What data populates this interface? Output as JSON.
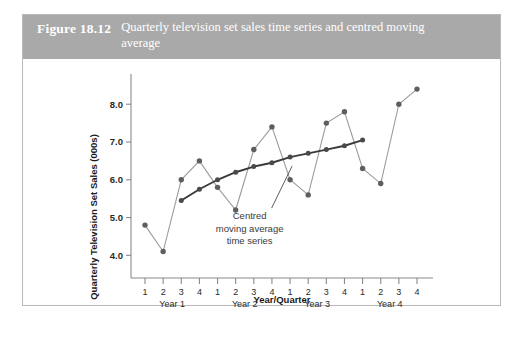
{
  "figure": {
    "number": "Figure 18.12",
    "title": "Quarterly television set sales time series and centred moving average"
  },
  "chart_data": {
    "type": "line",
    "title": "Quarterly television set sales time series and centred moving average",
    "xlabel": "Year/Quarter",
    "ylabel": "Quarterly Television Set Sales (000s)",
    "ylim": [
      3.4,
      8.8
    ],
    "yticks": [
      4.0,
      5.0,
      6.0,
      7.0,
      8.0
    ],
    "ytick_labels": [
      "4.0",
      "5.0",
      "6.0",
      "7.0",
      "8.0"
    ],
    "grid": false,
    "legend": false,
    "x": [
      1,
      2,
      3,
      4,
      5,
      6,
      7,
      8,
      9,
      10,
      11,
      12,
      13,
      14,
      15,
      16
    ],
    "xtick_labels": [
      "1",
      "2",
      "3",
      "4",
      "1",
      "2",
      "3",
      "4",
      "1",
      "2",
      "3",
      "4",
      "1",
      "2",
      "3",
      "4"
    ],
    "xgroups": [
      {
        "label": "Year 1",
        "quarters": [
          "1",
          "2",
          "3",
          "4"
        ]
      },
      {
        "label": "Year 2",
        "quarters": [
          "1",
          "2",
          "3",
          "4"
        ]
      },
      {
        "label": "Year 3",
        "quarters": [
          "1",
          "2",
          "3",
          "4"
        ]
      },
      {
        "label": "Year 4",
        "quarters": [
          "1",
          "2",
          "3",
          "4"
        ]
      }
    ],
    "series": [
      {
        "name": "Quarterly television set sales",
        "values": [
          4.8,
          4.1,
          6.0,
          6.5,
          5.8,
          5.2,
          6.8,
          7.4,
          6.0,
          5.6,
          7.5,
          7.8,
          6.3,
          5.9,
          8.0,
          8.4
        ]
      },
      {
        "name": "Centred moving average time series",
        "values": [
          null,
          null,
          5.45,
          5.75,
          6.0,
          6.2,
          6.35,
          6.45,
          6.6,
          6.7,
          6.8,
          6.9,
          7.05,
          null,
          null,
          null
        ]
      }
    ],
    "annotations": [
      {
        "text_lines": [
          "Centred",
          "moving average",
          "time series"
        ],
        "points_to_series": "Centred moving average time series",
        "points_to_index": 8
      }
    ],
    "colors": {
      "series_line": "#9b9b9b",
      "series_marker": "#5e5e5e",
      "ma_line": "#3a3a3a",
      "ma_marker": "#4a4a4a",
      "axis": "#8a8a8a",
      "caption_band": "#a9a9a9",
      "caption_text": "#ffffff"
    }
  }
}
